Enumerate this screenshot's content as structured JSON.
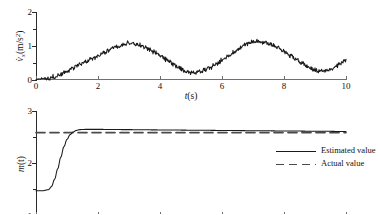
{
  "figure": {
    "background": "#ffffff",
    "ink": "#1a1a1a"
  },
  "chart_data": [
    {
      "id": "acceleration-panel",
      "type": "line",
      "title": "",
      "xlabel": "t(s)",
      "ylabel": "v̇x(m/s²)",
      "ylabel_parts": {
        "symbol": "v",
        "dot": "˙",
        "subscript": "x",
        "units": "(m/s",
        "units_sup": "2",
        "units_end": ")"
      },
      "xlim": [
        0,
        10
      ],
      "ylim": [
        0,
        2
      ],
      "xticks": [
        0,
        2,
        4,
        6,
        8,
        10
      ],
      "xticklabels": [
        "0",
        "2",
        "4",
        "6",
        "8",
        "10"
      ],
      "yticks": [
        0,
        1,
        2
      ],
      "yticklabels": [
        "0",
        "1",
        "2"
      ],
      "grid": false,
      "legend": null,
      "noise": {
        "present": true,
        "amplitude": 0.05,
        "description": "high-frequency measurement noise on smooth sinusoid"
      },
      "series": [
        {
          "name": "measured acceleration",
          "style": "solid",
          "color": "#1a1a1a",
          "x": [
            0.0,
            0.2,
            0.4,
            0.6,
            0.8,
            1.0,
            1.2,
            1.4,
            1.6,
            1.8,
            2.0,
            2.2,
            2.4,
            2.6,
            2.8,
            3.0,
            3.2,
            3.4,
            3.6,
            3.8,
            4.0,
            4.2,
            4.4,
            4.6,
            4.8,
            5.0,
            5.2,
            5.4,
            5.6,
            5.8,
            6.0,
            6.2,
            6.4,
            6.6,
            6.8,
            7.0,
            7.2,
            7.4,
            7.6,
            7.8,
            8.0,
            8.2,
            8.4,
            8.6,
            8.8,
            9.0,
            9.2,
            9.4,
            9.6,
            9.8,
            10.0
          ],
          "y": [
            0.02,
            0.05,
            0.05,
            0.1,
            0.17,
            0.25,
            0.35,
            0.45,
            0.54,
            0.62,
            0.7,
            0.8,
            0.9,
            0.98,
            1.05,
            1.08,
            1.07,
            1.02,
            0.94,
            0.84,
            0.72,
            0.6,
            0.48,
            0.36,
            0.26,
            0.21,
            0.22,
            0.28,
            0.36,
            0.46,
            0.58,
            0.7,
            0.82,
            0.95,
            1.06,
            1.13,
            1.14,
            1.11,
            1.05,
            0.96,
            0.85,
            0.72,
            0.6,
            0.48,
            0.38,
            0.3,
            0.26,
            0.28,
            0.36,
            0.47,
            0.58
          ]
        }
      ]
    },
    {
      "id": "mass-estimation-panel",
      "type": "line",
      "title": "",
      "xlabel": "t(s)",
      "ylabel": "m(t)",
      "xlim": [
        0,
        10
      ],
      "ylim": [
        1,
        3
      ],
      "xticks": [
        0,
        2,
        4,
        6,
        8,
        10
      ],
      "xticklabels": [
        "0",
        "2",
        "4",
        "6",
        "8",
        "10"
      ],
      "yticks": [
        1,
        2,
        3
      ],
      "yticklabels": [
        "1",
        "2",
        "3"
      ],
      "grid": false,
      "legend": {
        "position": "right",
        "entries": [
          "Estimated value",
          "Actual value"
        ]
      },
      "series": [
        {
          "name": "Estimated value",
          "style": "solid",
          "color": "#1a1a1a",
          "x": [
            0.0,
            0.2,
            0.4,
            0.5,
            0.6,
            0.7,
            0.8,
            0.9,
            1.0,
            1.1,
            1.2,
            1.3,
            1.4,
            1.6,
            2.0,
            3.0,
            4.0,
            5.0,
            6.0,
            7.0,
            8.0,
            9.0,
            10.0
          ],
          "y": [
            1.48,
            1.48,
            1.5,
            1.56,
            1.7,
            1.9,
            2.12,
            2.32,
            2.46,
            2.55,
            2.6,
            2.63,
            2.645,
            2.65,
            2.65,
            2.645,
            2.64,
            2.635,
            2.63,
            2.625,
            2.62,
            2.615,
            2.61
          ]
        },
        {
          "name": "Actual value",
          "style": "dashed",
          "color": "#4a4a4a",
          "x": [
            0.0,
            10.0
          ],
          "y": [
            2.59,
            2.59
          ],
          "constant": 2.59
        }
      ]
    }
  ]
}
